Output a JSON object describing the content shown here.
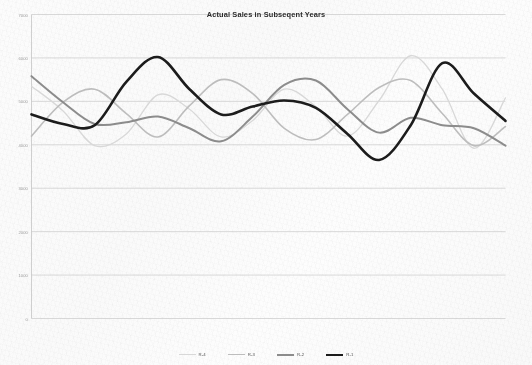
{
  "chart_data": {
    "type": "line",
    "title": "Actual Sales in Subseqent Years",
    "xlabel": "",
    "ylabel": "",
    "ylim": [
      0,
      7000
    ],
    "yticks": [
      0,
      1000,
      2000,
      3000,
      4000,
      5000,
      6000,
      7000
    ],
    "ytick_labels": [
      "0",
      "1000",
      "2000",
      "3000",
      "4000",
      "5000",
      "6000",
      "7000"
    ],
    "grid": true,
    "xaxis_visible": false,
    "legend_position": "bottom",
    "smoothing": "spline",
    "x": [
      0,
      1,
      2,
      3,
      4,
      5,
      6,
      7,
      8,
      9,
      10,
      11,
      12,
      13,
      14,
      15
    ],
    "series": [
      {
        "name": "R-4",
        "color": "#d8d8d8",
        "width": 1.3,
        "values": [
          5350,
          4780,
          3980,
          4250,
          5150,
          4820,
          4180,
          4560,
          5280,
          4880,
          4200,
          5020,
          6050,
          5280,
          3920,
          5080
        ]
      },
      {
        "name": "R-3",
        "color": "#bdbdbd",
        "width": 1.6,
        "values": [
          4200,
          4980,
          5280,
          4720,
          4180,
          4900,
          5500,
          5180,
          4380,
          4120,
          4700,
          5320,
          5480,
          4720,
          3980,
          4420
        ]
      },
      {
        "name": "R-2",
        "color": "#8c8c8c",
        "width": 2.0,
        "values": [
          5580,
          4980,
          4480,
          4520,
          4650,
          4380,
          4080,
          4650,
          5380,
          5480,
          4820,
          4280,
          4620,
          4450,
          4380,
          3980
        ]
      },
      {
        "name": "R-1",
        "color": "#1c1c1c",
        "width": 2.6,
        "values": [
          4700,
          4480,
          4450,
          5450,
          6020,
          5280,
          4700,
          4880,
          5020,
          4850,
          4250,
          3650,
          4450,
          5880,
          5180,
          4550
        ]
      }
    ]
  }
}
